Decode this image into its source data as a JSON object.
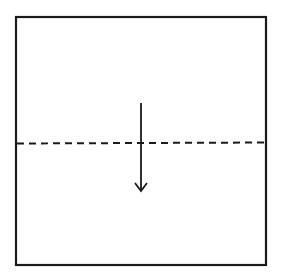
{
  "diagram": {
    "type": "origami-fold-step",
    "background": "#ffffff",
    "stroke_color": "#1a1a1a",
    "paper": {
      "shape": "square",
      "x": 16,
      "y": 17,
      "width": 250,
      "height": 248,
      "stroke_width": 2.2
    },
    "fold_line": {
      "style": "dashed",
      "kind": "valley-fold",
      "x1": 17,
      "y1": 143.5,
      "x2": 265,
      "y2": 142.5,
      "dash": "7 5",
      "stroke_width": 2
    },
    "arrow": {
      "direction": "down",
      "x1": 141,
      "y1": 103,
      "x2": 141,
      "y2": 191,
      "head_left": [
        135,
        183
      ],
      "head_right": [
        147,
        183
      ],
      "stroke_width": 1.8
    }
  }
}
